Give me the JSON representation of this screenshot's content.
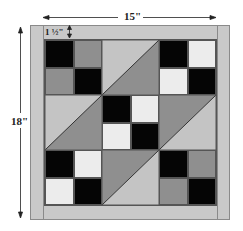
{
  "diagram": {
    "type": "quilt-block-layout",
    "dimensions": {
      "width_label": "15\"",
      "height_label": "18\"",
      "border_label": "1 ½\""
    },
    "colors": {
      "border": "#c9c9c9",
      "black": "#050505",
      "white": "#ececec",
      "medium_gray": "#8f8f8f",
      "light_gray": "#c4c4c4",
      "outline": "#555555"
    },
    "grid": {
      "rows": 3,
      "cols": 3,
      "blocks": [
        {
          "position": "top-left",
          "kind": "four-patch",
          "cells": [
            "black",
            "medium_gray",
            "medium_gray",
            "black"
          ]
        },
        {
          "position": "top-center",
          "kind": "half-square-triangle",
          "upper_left": "light_gray",
          "lower_right": "medium_gray"
        },
        {
          "position": "top-right",
          "kind": "four-patch",
          "cells": [
            "black",
            "white",
            "white",
            "black"
          ]
        },
        {
          "position": "middle-left",
          "kind": "half-square-triangle",
          "upper_left": "light_gray",
          "lower_right": "medium_gray"
        },
        {
          "position": "center",
          "kind": "four-patch",
          "cells": [
            "black",
            "white",
            "white",
            "black"
          ]
        },
        {
          "position": "middle-right",
          "kind": "half-square-triangle",
          "upper_left": "medium_gray",
          "lower_right": "light_gray"
        },
        {
          "position": "bottom-left",
          "kind": "four-patch",
          "cells": [
            "black",
            "white",
            "white",
            "black"
          ]
        },
        {
          "position": "bottom-center",
          "kind": "half-square-triangle",
          "upper_left": "medium_gray",
          "lower_right": "light_gray"
        },
        {
          "position": "bottom-right",
          "kind": "four-patch",
          "cells": [
            "black",
            "medium_gray",
            "medium_gray",
            "black"
          ]
        }
      ]
    }
  }
}
